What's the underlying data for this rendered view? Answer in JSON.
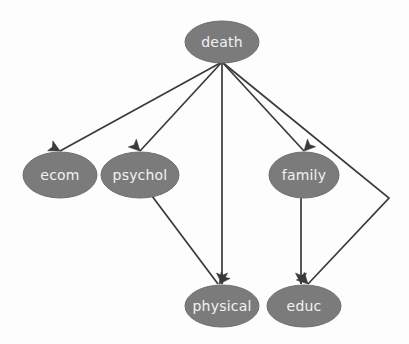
{
  "diagram": {
    "type": "directed-acyclic-graph",
    "background_color": "#fdfdfd",
    "node_fill_color": "#7b7b7b",
    "node_text_color": "#f2f2f2",
    "edge_color": "#3a3a3a",
    "nodes": [
      {
        "id": "death",
        "label": "death",
        "cx": 222,
        "cy": 42,
        "rx": 37,
        "ry": 21
      },
      {
        "id": "ecom",
        "label": "ecom",
        "cx": 60,
        "cy": 175,
        "rx": 37,
        "ry": 23
      },
      {
        "id": "psychol",
        "label": "psychol",
        "cx": 140,
        "cy": 175,
        "rx": 39,
        "ry": 23
      },
      {
        "id": "family",
        "label": "family",
        "cx": 304,
        "cy": 175,
        "rx": 35,
        "ry": 23
      },
      {
        "id": "physical",
        "label": "physical",
        "cx": 222,
        "cy": 306,
        "rx": 37,
        "ry": 21
      },
      {
        "id": "educ",
        "label": "educ",
        "cx": 304,
        "cy": 306,
        "rx": 37,
        "ry": 21
      }
    ],
    "edges": [
      {
        "id": "death-ecom",
        "from": "death",
        "to": "ecom",
        "points": "222,62 60,151"
      },
      {
        "id": "death-psychol",
        "from": "death",
        "to": "psychol",
        "points": "222,62 140,151"
      },
      {
        "id": "death-physical",
        "from": "death",
        "to": "physical",
        "points": "222,62 222,284"
      },
      {
        "id": "death-family",
        "from": "death",
        "to": "family",
        "points": "222,62 304,151"
      },
      {
        "id": "death-educ",
        "from": "death",
        "to": "educ",
        "points": "222,62 389,198 308,284"
      },
      {
        "id": "psychol-physical",
        "from": "psychol",
        "to": "physical",
        "points": "152,196 218,284"
      },
      {
        "id": "family-educ",
        "from": "family",
        "to": "educ",
        "points": "301,198 301,284"
      }
    ],
    "arrowheads": [
      {
        "id": "arrow-ecom",
        "x": 60,
        "y": 151,
        "angle": 208
      },
      {
        "id": "arrow-psychol",
        "x": 140,
        "y": 151,
        "angle": 226
      },
      {
        "id": "arrow-family",
        "x": 304,
        "y": 151,
        "angle": 313
      },
      {
        "id": "arrow-physical-a",
        "x": 222,
        "y": 284,
        "angle": 270
      },
      {
        "id": "arrow-physical-b",
        "x": 219,
        "y": 284,
        "angle": 307
      },
      {
        "id": "arrow-educ-a",
        "x": 301,
        "y": 284,
        "angle": 270
      },
      {
        "id": "arrow-educ-b",
        "x": 308,
        "y": 284,
        "angle": 226
      }
    ]
  }
}
